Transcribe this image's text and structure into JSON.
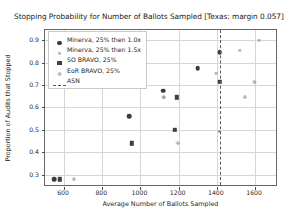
{
  "chart_data": {
    "type": "scatter",
    "title": "Stopping Probability for Number of Ballots Sampled [Texas: margin 0.057]",
    "xlabel": "Average Number of Ballots Sampled",
    "ylabel": "Proportion of Audits that Stopped",
    "xlim": [
      500,
      1720
    ],
    "ylim": [
      0.245,
      0.945
    ],
    "xticks": [
      600,
      800,
      1000,
      1200,
      1400,
      1600
    ],
    "yticks": [
      0.3,
      0.4,
      0.5,
      0.6,
      0.7,
      0.8,
      0.9
    ],
    "grid": true,
    "legend_position": "upper left",
    "series": [
      {
        "name": "Minerva, 25% then 1.0x",
        "marker": "circle",
        "color": "#3b3b3b",
        "points": [
          {
            "x": 548,
            "y": 0.28
          },
          {
            "x": 940,
            "y": 0.56
          },
          {
            "x": 1120,
            "y": 0.675
          },
          {
            "x": 1300,
            "y": 0.775
          },
          {
            "x": 1415,
            "y": 0.845
          }
        ]
      },
      {
        "name": "Minerva, 25% then 1.5x",
        "marker": "x",
        "color": "#8a8a8a",
        "points": [
          {
            "x": 1122,
            "y": 0.645
          },
          {
            "x": 1395,
            "y": 0.755
          },
          {
            "x": 1520,
            "y": 0.855
          },
          {
            "x": 1620,
            "y": 0.9
          }
        ]
      },
      {
        "name": "SO BRAVO, 25%",
        "marker": "square",
        "color": "#3f3f3f",
        "points": [
          {
            "x": 578,
            "y": 0.28
          },
          {
            "x": 955,
            "y": 0.44
          },
          {
            "x": 1180,
            "y": 0.5
          },
          {
            "x": 1190,
            "y": 0.645
          },
          {
            "x": 1415,
            "y": 0.715
          }
        ]
      },
      {
        "name": "EoR BRAVO, 25%",
        "marker": "eor",
        "color": "#8a8a8a",
        "points": [
          {
            "x": 650,
            "y": 0.28
          },
          {
            "x": 1195,
            "y": 0.44
          },
          {
            "x": 1120,
            "y": 0.645
          },
          {
            "x": 1545,
            "y": 0.645
          },
          {
            "x": 1595,
            "y": 0.715
          }
        ]
      },
      {
        "name": "ASN",
        "marker": "dashed-vline",
        "color": "#5a5a5a",
        "vline_x": 1415,
        "points": [
          {
            "x": 1415,
            "y": 0.5
          }
        ]
      }
    ]
  },
  "legend": {
    "items": [
      {
        "label": "Minerva, 25% then 1.0x",
        "marker": "circle"
      },
      {
        "label": "Minerva, 25% then 1.5x",
        "marker": "x"
      },
      {
        "label": "SO BRAVO, 25%",
        "marker": "square"
      },
      {
        "label": "EoR BRAVO, 25%",
        "marker": "eor"
      },
      {
        "label": "ASN",
        "marker": "dashed-line"
      }
    ]
  }
}
